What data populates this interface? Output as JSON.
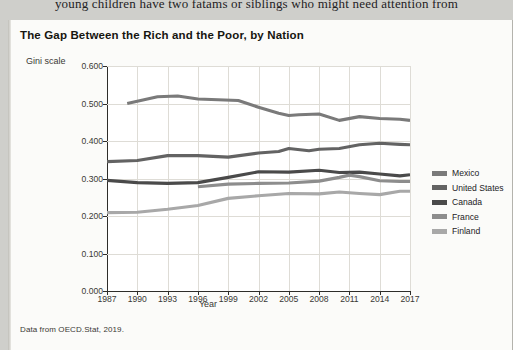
{
  "page": {
    "running_text": "young children have two fatams or siblings who might need attention from"
  },
  "figure": {
    "title": "The Gap Between the Rich and the Poor, by Nation",
    "source": "Data from OECD.Stat, 2019."
  },
  "legend": {
    "position": "right",
    "items": [
      {
        "label": "Mexico",
        "color": "#7a7a7a"
      },
      {
        "label": "United States",
        "color": "#636363"
      },
      {
        "label": "Canada",
        "color": "#4a4a4a"
      },
      {
        "label": "France",
        "color": "#8d8d8d"
      },
      {
        "label": "Finland",
        "color": "#a8a8a8"
      }
    ]
  },
  "chart_data": {
    "type": "line",
    "title": "The Gap Between the Rich and the Poor, by Nation",
    "xlabel": "Year",
    "ylabel": "Gini scale",
    "xlim": [
      1987,
      2017
    ],
    "ylim": [
      0.0,
      0.6
    ],
    "grid": true,
    "legend_position": "right",
    "xticks": [
      1987,
      1990,
      1993,
      1996,
      1999,
      2002,
      2005,
      2008,
      2011,
      2014,
      2017
    ],
    "xtick_labels": [
      "1987",
      "1990",
      "1993",
      "1996",
      "1999",
      "2002",
      "2005",
      "2008",
      "2011",
      "2014",
      "2017"
    ],
    "yticks": [
      0.0,
      0.1,
      0.2,
      0.3,
      0.4,
      0.5,
      0.6
    ],
    "ytick_labels": [
      "0.000",
      "0.100",
      "0.200",
      "0.300",
      "0.400",
      "0.500",
      "0.600"
    ],
    "series": [
      {
        "name": "Mexico",
        "color": "#7a7a7a",
        "x": [
          1989,
          1992,
          1994,
          1996,
          1998,
          2000,
          2002,
          2004,
          2005,
          2006,
          2008,
          2010,
          2012,
          2014,
          2016,
          2017
        ],
        "values": [
          0.5,
          0.518,
          0.52,
          0.512,
          0.51,
          0.508,
          0.49,
          0.474,
          0.468,
          0.47,
          0.472,
          0.455,
          0.465,
          0.46,
          0.458,
          0.455
        ]
      },
      {
        "name": "United States",
        "color": "#636363",
        "x": [
          1987,
          1990,
          1993,
          1996,
          1999,
          2002,
          2004,
          2005,
          2007,
          2008,
          2010,
          2012,
          2014,
          2016,
          2017
        ],
        "values": [
          0.345,
          0.348,
          0.361,
          0.361,
          0.357,
          0.368,
          0.372,
          0.38,
          0.374,
          0.378,
          0.38,
          0.39,
          0.394,
          0.391,
          0.39
        ]
      },
      {
        "name": "Canada",
        "color": "#4a4a4a",
        "x": [
          1987,
          1990,
          1993,
          1996,
          1999,
          2002,
          2005,
          2008,
          2010,
          2012,
          2014,
          2016,
          2017
        ],
        "values": [
          0.295,
          0.289,
          0.287,
          0.289,
          0.303,
          0.318,
          0.317,
          0.322,
          0.316,
          0.317,
          0.312,
          0.307,
          0.31
        ]
      },
      {
        "name": "France",
        "color": "#8d8d8d",
        "x": [
          1996,
          1999,
          2002,
          2005,
          2008,
          2010,
          2011,
          2012,
          2014,
          2016,
          2017
        ],
        "values": [
          0.278,
          0.285,
          0.287,
          0.288,
          0.293,
          0.303,
          0.309,
          0.305,
          0.294,
          0.292,
          0.292
        ]
      },
      {
        "name": "Finland",
        "color": "#a8a8a8",
        "x": [
          1987,
          1990,
          1993,
          1996,
          1999,
          2002,
          2005,
          2008,
          2010,
          2012,
          2014,
          2016,
          2017
        ],
        "values": [
          0.209,
          0.21,
          0.218,
          0.228,
          0.247,
          0.254,
          0.26,
          0.259,
          0.264,
          0.26,
          0.257,
          0.266,
          0.266
        ]
      }
    ]
  }
}
